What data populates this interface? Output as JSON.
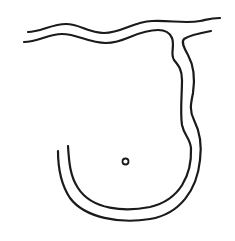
{
  "diagram": {
    "colors": {
      "stroke": "#1a1a1a",
      "background": "#ffffff"
    },
    "elements": [
      {
        "id": "top-channel-upper-wall"
      },
      {
        "id": "top-channel-lower-wall"
      },
      {
        "id": "branch-inner-wall"
      },
      {
        "id": "branch-outer-wall"
      },
      {
        "id": "bottom-arc-inner"
      },
      {
        "id": "bottom-arc-outer"
      },
      {
        "id": "center-circle"
      }
    ]
  }
}
